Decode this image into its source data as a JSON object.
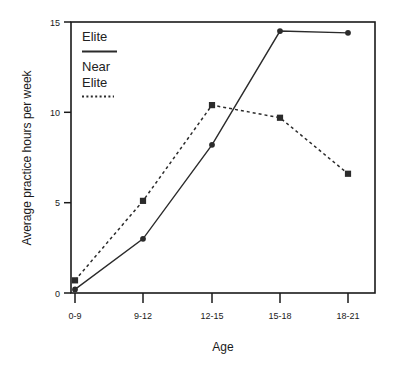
{
  "chart_data": {
    "type": "line",
    "title": "",
    "subtitle": "",
    "xlabel": "Age",
    "ylabel": "Average practice hours per week",
    "categories": [
      "0-9",
      "9-12",
      "12-15",
      "15-18",
      "18-21"
    ],
    "series": [
      {
        "name": "Elite",
        "values": [
          0.2,
          3.0,
          8.2,
          14.5,
          14.4
        ],
        "line_style": "solid",
        "marker": "circle",
        "color": "#2b2b2b"
      },
      {
        "name": "Near Elite",
        "values": [
          0.7,
          5.1,
          10.4,
          9.7,
          6.6
        ],
        "line_style": "dotted",
        "marker": "square",
        "color": "#2b2b2b"
      }
    ],
    "ylim": [
      0,
      15
    ],
    "yticks": [
      0,
      5,
      10,
      15
    ],
    "ytick_labels": [
      "0",
      "5",
      "10",
      "15"
    ],
    "xtick_labels": [
      "0-9",
      "9-12",
      "12-15",
      "15-18",
      "18-21"
    ],
    "grid": false,
    "legend_position": "top-left-inside",
    "frame": "box"
  },
  "legend": {
    "entries": [
      {
        "label_line1": "Elite",
        "label_line2": "",
        "key": "solid-line-key"
      },
      {
        "label_line1": "Near",
        "label_line2": "Elite",
        "key": "dotted-line-key"
      }
    ]
  },
  "axes": {
    "y_title": "Average practice hours per week",
    "x_title": "Age",
    "y_tick_0": "0",
    "y_tick_5": "5",
    "y_tick_10": "10",
    "y_tick_15": "15",
    "x_tick_0": "0-9",
    "x_tick_1": "9-12",
    "x_tick_2": "12-15",
    "x_tick_3": "15-18",
    "x_tick_4": "18-21"
  },
  "colors": {
    "ink": "#1a1a1a",
    "series": "#2b2b2b",
    "background": "#ffffff"
  }
}
